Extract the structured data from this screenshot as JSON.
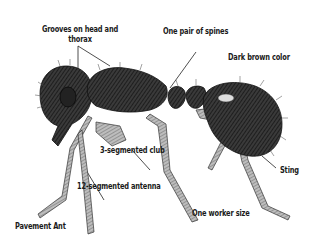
{
  "diagram": {
    "title": "Pavement Ant",
    "labels": {
      "grooves_line1": "Grooves on head and",
      "grooves_line2": "thorax",
      "spines": "One pair of spines",
      "color": "Dark brown color",
      "club": "3-segmented club",
      "antenna": "12-segmented antenna",
      "sting": "Sting",
      "worker_size": "One worker size"
    },
    "colors": {
      "ink": "#1a1a1a",
      "background": "#ffffff"
    }
  }
}
